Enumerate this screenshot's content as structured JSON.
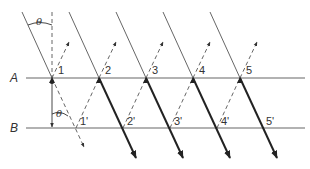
{
  "diagram": {
    "title": "",
    "planes": [
      {
        "label": "A",
        "y": 78
      },
      {
        "label": "B",
        "y": 128
      }
    ],
    "angle_label": "θ",
    "points_A": [
      {
        "label": "1",
        "x": 52
      },
      {
        "label": "2",
        "x": 99
      },
      {
        "label": "3",
        "x": 146
      },
      {
        "label": "4",
        "x": 193
      },
      {
        "label": "5",
        "x": 240
      }
    ],
    "points_B": [
      {
        "label": "1'",
        "x": 76
      },
      {
        "label": "2'",
        "x": 123
      },
      {
        "label": "3'",
        "x": 170
      },
      {
        "label": "4'",
        "x": 217
      },
      {
        "label": "5'",
        "x": 264
      }
    ],
    "colors": {
      "line": "#555555",
      "thick_line": "#222222",
      "plane": "#666666",
      "text": "#333333"
    }
  }
}
